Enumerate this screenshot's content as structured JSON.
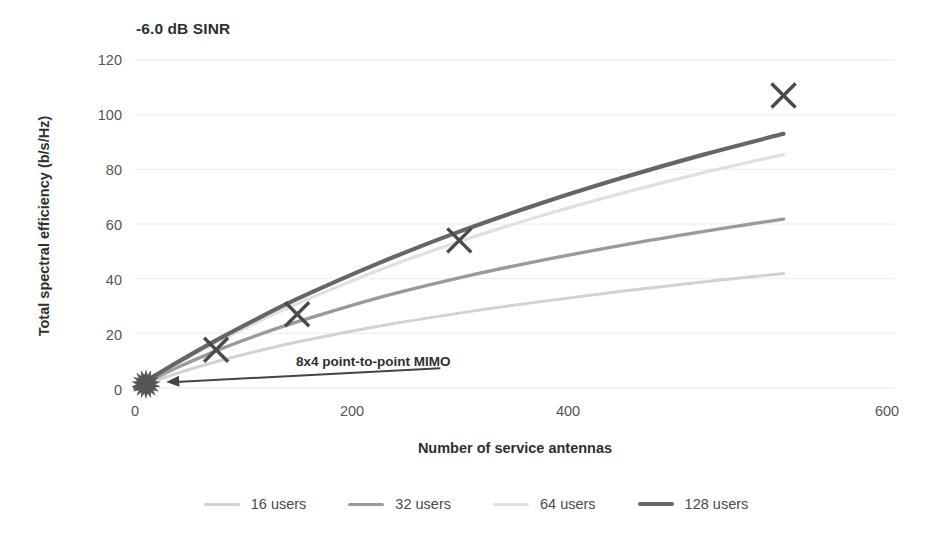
{
  "chart_data": {
    "type": "line",
    "title": "-6.0 dB SINR",
    "xlabel": "Number of service antennas",
    "ylabel": "Total spectral efficiency (b/s/Hz)",
    "xlim": [
      0,
      600
    ],
    "ylim": [
      0,
      120
    ],
    "xticks": [
      "0",
      "200",
      "400",
      "600"
    ],
    "yticks": [
      "0",
      "20",
      "40",
      "60",
      "80",
      "100",
      "120"
    ],
    "grid": "horizontal",
    "legend_position": "bottom",
    "series": [
      {
        "name": "16 users",
        "color": "#d2d2d2",
        "width": 3.0,
        "x": [
          0,
          32,
          64,
          96,
          128,
          192,
          256,
          320,
          384,
          448,
          512
        ],
        "values": [
          0,
          5.2,
          9.6,
          13.4,
          16.8,
          22.6,
          27.4,
          31.6,
          35.4,
          38.8,
          41.9
        ]
      },
      {
        "name": "32 users",
        "color": "#9a9a9a",
        "width": 3.4,
        "x": [
          0,
          32,
          64,
          96,
          128,
          192,
          256,
          320,
          384,
          448,
          512
        ],
        "values": [
          0,
          7.2,
          13.6,
          19.2,
          24.2,
          33.0,
          40.3,
          46.6,
          52.2,
          57.2,
          61.8
        ]
      },
      {
        "name": "64 users",
        "color": "#e0e0e0",
        "width": 3.2,
        "x": [
          0,
          32,
          64,
          96,
          128,
          192,
          256,
          320,
          384,
          448,
          512
        ],
        "values": [
          0,
          8.6,
          16.6,
          24.0,
          30.8,
          43.0,
          53.6,
          62.9,
          71.2,
          78.7,
          85.4
        ]
      },
      {
        "name": "128 users",
        "color": "#666666",
        "width": 4.2,
        "x": [
          0,
          32,
          64,
          96,
          128,
          192,
          256,
          320,
          384,
          448,
          512
        ],
        "values": [
          0,
          9.0,
          17.4,
          25.2,
          32.6,
          45.6,
          57.2,
          67.5,
          76.8,
          85.3,
          93.0
        ]
      }
    ],
    "markers": {
      "name": "128-users-markers",
      "symbol": "x",
      "color": "#4a4a4a",
      "points": [
        {
          "x": 64,
          "y": 14
        },
        {
          "x": 128,
          "y": 27
        },
        {
          "x": 256,
          "y": 54
        },
        {
          "x": 512,
          "y": 107
        }
      ]
    },
    "origin_marker": {
      "name": "8x4 point-to-point MIMO",
      "symbol": "starburst",
      "color": "#555555",
      "x": 0,
      "y": 1
    },
    "annotation": {
      "text": "8x4 point-to-point MIMO",
      "arrow_from": {
        "x": 200,
        "y": 5
      },
      "arrow_to": {
        "x": 12,
        "y": 1.5
      }
    }
  }
}
